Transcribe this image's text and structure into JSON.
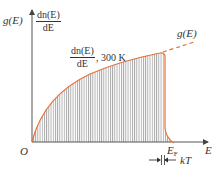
{
  "diagram": {
    "y_axis": {
      "label_left": "g(E)",
      "label_right_numerator": "dn(E)",
      "label_right_denominator": "dE"
    },
    "x_axis": {
      "label": "E",
      "origin_label": "O",
      "fermi_label": "E",
      "fermi_subscript": "F"
    },
    "curve_labels": {
      "g_curve": "g(E)",
      "distribution_numerator": "dn(E)",
      "distribution_denominator": "dE",
      "temperature": ", 300 K"
    },
    "thermal_width_label": "kT",
    "colors": {
      "curve": "#e8703a",
      "axis": "#555555",
      "hatch": "#777777"
    }
  }
}
